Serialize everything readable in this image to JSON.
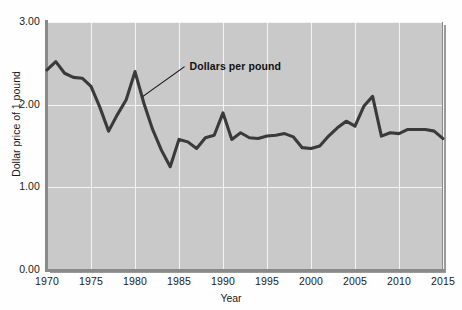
{
  "chart_data": {
    "type": "line",
    "title": "",
    "xlabel": "Year",
    "ylabel": "Dollar price of 1 pound",
    "xlim": [
      1970,
      2015
    ],
    "ylim": [
      0.0,
      3.0
    ],
    "grid": true,
    "legend_position": "none",
    "y_ticks": [
      "0.00",
      "1.00",
      "2.00",
      "3.00"
    ],
    "y_tick_values": [
      0.0,
      1.0,
      2.0,
      3.0
    ],
    "x_ticks": [
      "1970",
      "1975",
      "1980",
      "1985",
      "1990",
      "1995",
      "2000",
      "2005",
      "2010",
      "2015"
    ],
    "x_tick_values": [
      1970,
      1975,
      1980,
      1985,
      1990,
      1995,
      2000,
      2005,
      2010,
      2015
    ],
    "annotations": [
      {
        "text": "Dollars per pound",
        "text_x": 1986.2,
        "text_y": 2.46,
        "leader_to_x": 1980.9,
        "leader_to_y": 2.1
      }
    ],
    "series": [
      {
        "name": "Dollars per pound",
        "color": "#3a3a3a",
        "x": [
          1970,
          1971,
          1972,
          1973,
          1974,
          1975,
          1976,
          1977,
          1978,
          1979,
          1980,
          1981,
          1982,
          1983,
          1984,
          1985,
          1986,
          1987,
          1988,
          1989,
          1990,
          1991,
          1992,
          1993,
          1994,
          1995,
          1996,
          1997,
          1998,
          1999,
          2000,
          2001,
          2002,
          2003,
          2004,
          2005,
          2006,
          2007,
          2008,
          2009,
          2010,
          2011,
          2012,
          2013,
          2014,
          2015
        ],
        "values": [
          2.42,
          2.52,
          2.38,
          2.33,
          2.32,
          2.22,
          1.97,
          1.68,
          1.88,
          2.06,
          2.4,
          2.02,
          1.7,
          1.45,
          1.25,
          1.58,
          1.55,
          1.47,
          1.6,
          1.63,
          1.9,
          1.58,
          1.66,
          1.6,
          1.59,
          1.62,
          1.63,
          1.65,
          1.61,
          1.48,
          1.47,
          1.5,
          1.62,
          1.72,
          1.8,
          1.74,
          1.98,
          2.1,
          1.62,
          1.66,
          1.65,
          1.7,
          1.7,
          1.7,
          1.68,
          1.59
        ]
      }
    ]
  },
  "axis": {
    "x_title": "Year",
    "y_title": "Dollar price of 1 pound"
  }
}
